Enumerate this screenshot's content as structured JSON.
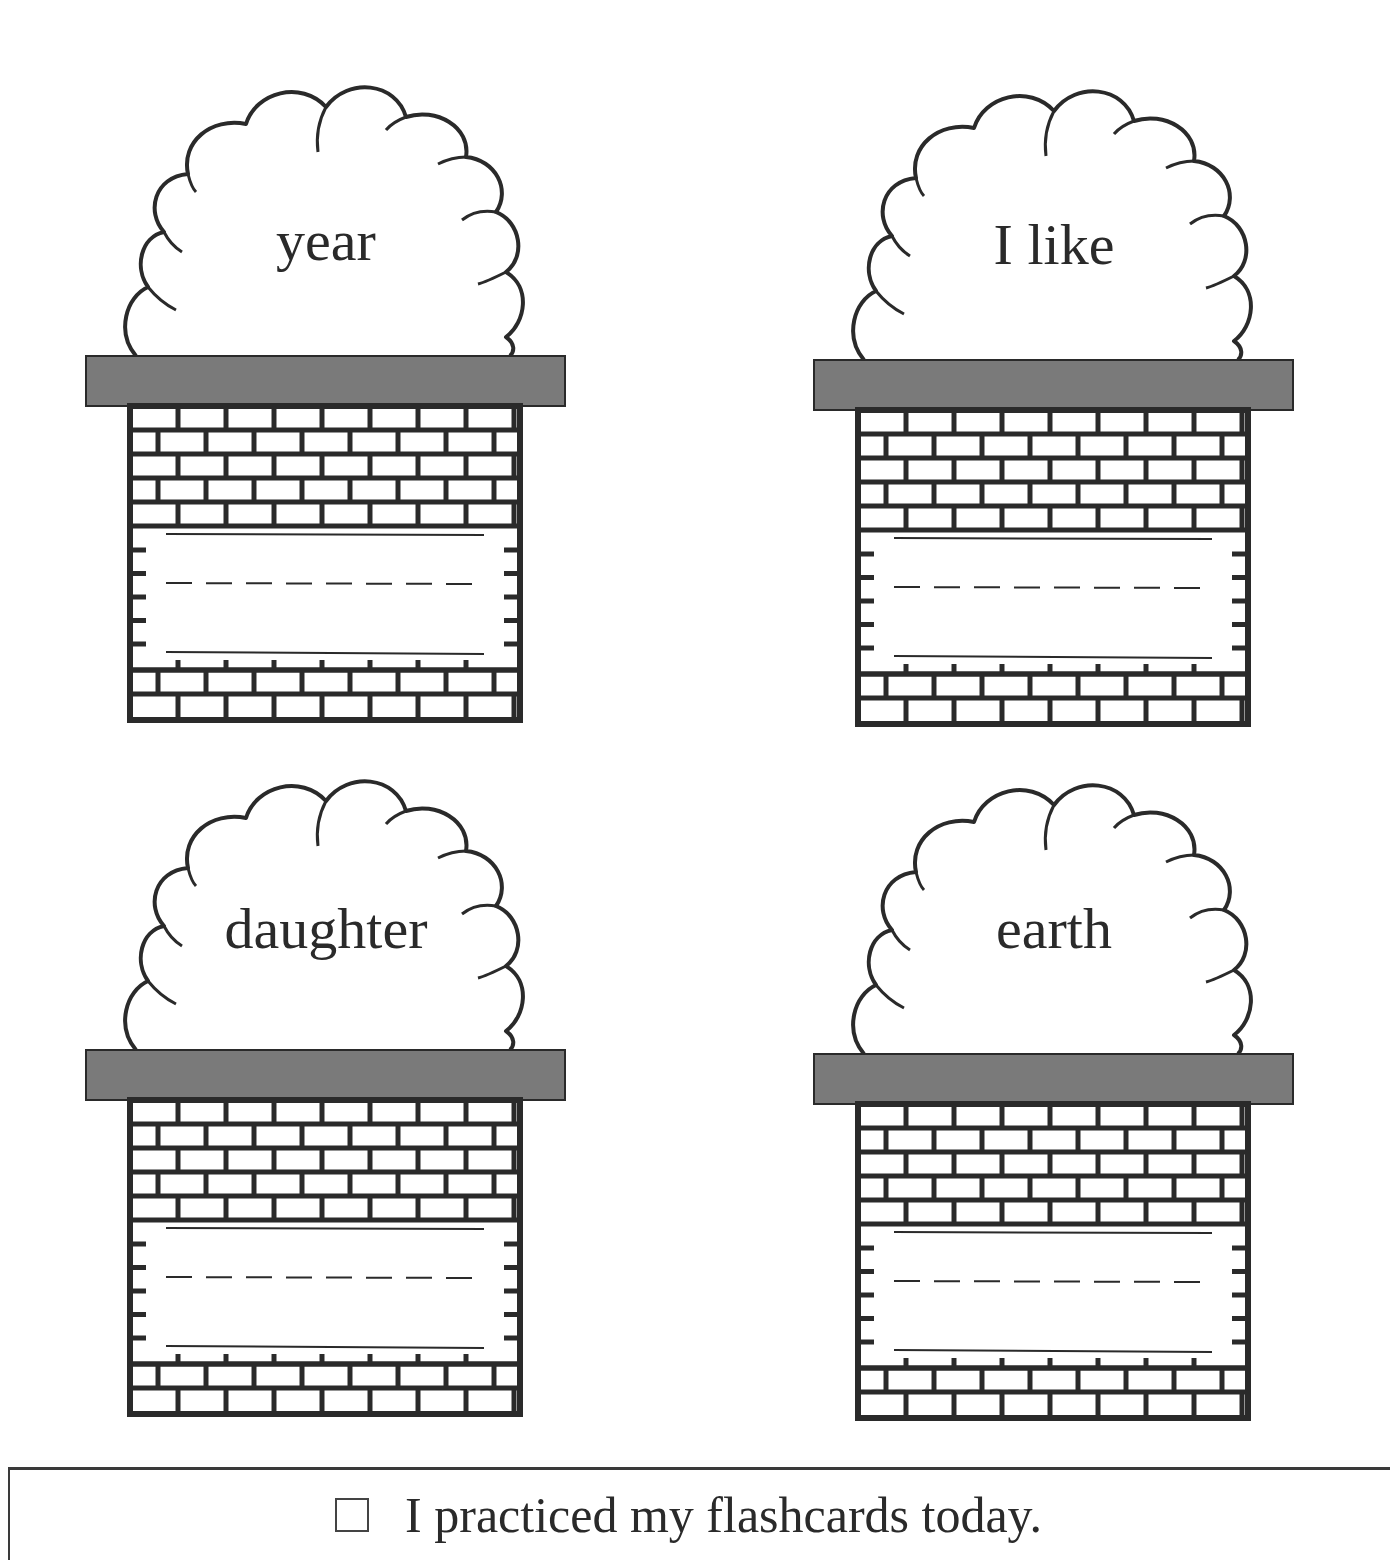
{
  "flashcards": [
    {
      "word": "year"
    },
    {
      "word": "I like"
    },
    {
      "word": "daughter"
    },
    {
      "word": "earth"
    }
  ],
  "footer": {
    "checkbox_label": "I practiced my flashcards today.",
    "checked": false
  },
  "colors": {
    "ink": "#2a2a2a",
    "cap": "#7a7a7a",
    "brick_fill": "#ffffff"
  }
}
